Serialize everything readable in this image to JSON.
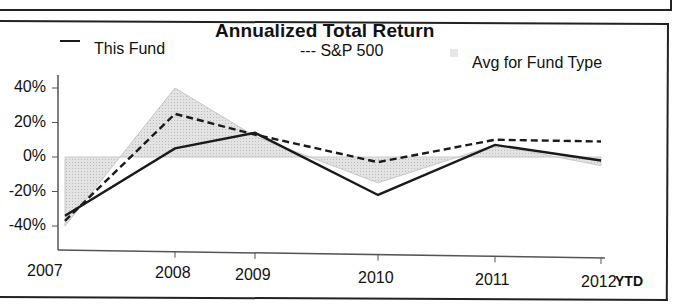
{
  "chart_data": {
    "type": "line",
    "title": "Annualized Total Return",
    "xlabel": "",
    "ylabel": "",
    "categories": [
      "2007",
      "2008",
      "2009",
      "2010",
      "2011",
      "2012"
    ],
    "x_suffix_label": "YTD",
    "ylim": [
      -45,
      50
    ],
    "yticks": [
      "40%",
      "20%",
      "0%",
      "-20%",
      "-40%"
    ],
    "ytick_values": [
      40,
      20,
      0,
      -20,
      -40
    ],
    "grid": false,
    "legend_position": "top",
    "series": [
      {
        "name": "This Fund",
        "style": "solid",
        "color": "#1a1a1a",
        "values": [
          -34,
          5,
          14,
          -22,
          7,
          -2
        ]
      },
      {
        "name": "S&P 500",
        "style": "dashed",
        "color": "#1a1a1a",
        "values": [
          -37,
          25,
          13,
          -3,
          10,
          9
        ]
      },
      {
        "name": "Avg for Fund Type",
        "style": "area",
        "color": "#cfcfcf",
        "values": [
          -40,
          40,
          12,
          -15,
          7,
          -5
        ]
      }
    ]
  },
  "legend": {
    "fund_label": "This Fund",
    "sp_label": "--- S&P 500",
    "avg_label": "Avg for Fund Type"
  }
}
